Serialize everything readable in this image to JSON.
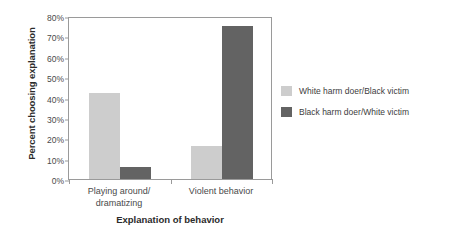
{
  "chart_data": {
    "type": "bar",
    "title": "",
    "xlabel": "Explanation of behavior",
    "ylabel": "Percent choosing explanation",
    "categories": [
      "Playing around/\ndramatizing",
      "Violent behavior"
    ],
    "series": [
      {
        "name": "White harm doer/Black victim",
        "color": "#cdcdcd",
        "values": [
          42,
          16
        ]
      },
      {
        "name": "Black harm doer/White victim",
        "color": "#636363",
        "values": [
          6,
          75
        ]
      }
    ],
    "ylim": [
      0,
      80
    ],
    "yticks": [
      "0%",
      "10%",
      "20%",
      "30%",
      "40%",
      "50%",
      "60%",
      "70%",
      "80%"
    ],
    "ytick_values": [
      0,
      10,
      20,
      30,
      40,
      50,
      60,
      70,
      80
    ],
    "grid": false,
    "legend_position": "right"
  },
  "legend": {
    "items": [
      {
        "label": "White harm doer/Black victim"
      },
      {
        "label": "Black harm doer/White victim"
      }
    ]
  },
  "axes": {
    "y_title": "Percent choosing explanation",
    "x_title": "Explanation of behavior"
  }
}
